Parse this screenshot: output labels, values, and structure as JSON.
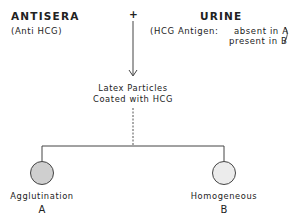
{
  "left": {
    "title": "ANTISERA",
    "subtitle": "(Anti HCG)"
  },
  "operator": "+",
  "right": {
    "title": "URINE",
    "subtitle_prefix": "(HCG Antigen:",
    "line1": "absent in A",
    "line2": "present in B"
  },
  "center": {
    "line1": "Latex Particles",
    "line2": "Coated with HCG"
  },
  "outcomes": [
    {
      "label": "Agglutination",
      "letter": "A",
      "fill": "#cfcfcf"
    },
    {
      "label": "Homogeneous",
      "letter": "B",
      "fill": "#ececec"
    }
  ]
}
